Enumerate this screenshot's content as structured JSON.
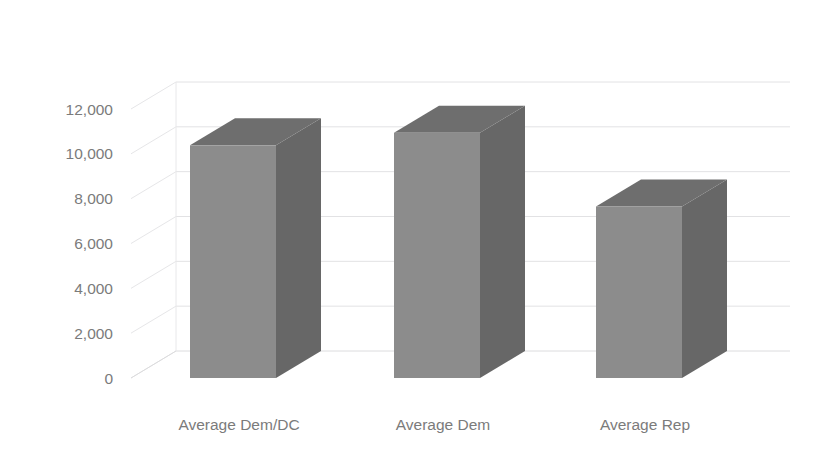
{
  "chart_data": {
    "type": "bar",
    "title": "",
    "subtitle": "",
    "xlabel": "",
    "ylabel": "",
    "categories": [
      "Average Dem/DC",
      "Average Dem",
      "Average Rep"
    ],
    "values": [
      10380,
      10940,
      7650
    ],
    "series": [
      {
        "name": "Average",
        "values": [
          10380,
          10940,
          7650
        ]
      }
    ],
    "ylim": [
      0,
      12000
    ],
    "ytick_labels": [
      "12,000",
      "10,000",
      "8,000",
      "6,000",
      "4,000",
      "2,000",
      "0"
    ],
    "ytick_values": [
      12000,
      10000,
      8000,
      6000,
      4000,
      2000,
      0
    ],
    "grid": true,
    "legend": false,
    "legend_position": "none",
    "three_d": true,
    "annotations": []
  },
  "colors": {
    "bar_front": "#8c8c8c",
    "bar_side": "#676767",
    "bar_top": "#6e6e6e",
    "gridline": "#e2e2e4",
    "wall": "#e8e8ea",
    "tick_text": "#7b7b7b",
    "background": "#ffffff"
  },
  "axis": {
    "y_ticks": [
      {
        "label": "12,000",
        "value": 12000
      },
      {
        "label": "10,000",
        "value": 10000
      },
      {
        "label": "8,000",
        "value": 8000
      },
      {
        "label": "6,000",
        "value": 6000
      },
      {
        "label": "4,000",
        "value": 4000
      },
      {
        "label": "2,000",
        "value": 2000
      },
      {
        "label": "0",
        "value": 0
      }
    ],
    "x_ticks": [
      {
        "label": "Average Dem/DC"
      },
      {
        "label": "Average Dem"
      },
      {
        "label": "Average Rep"
      }
    ]
  }
}
